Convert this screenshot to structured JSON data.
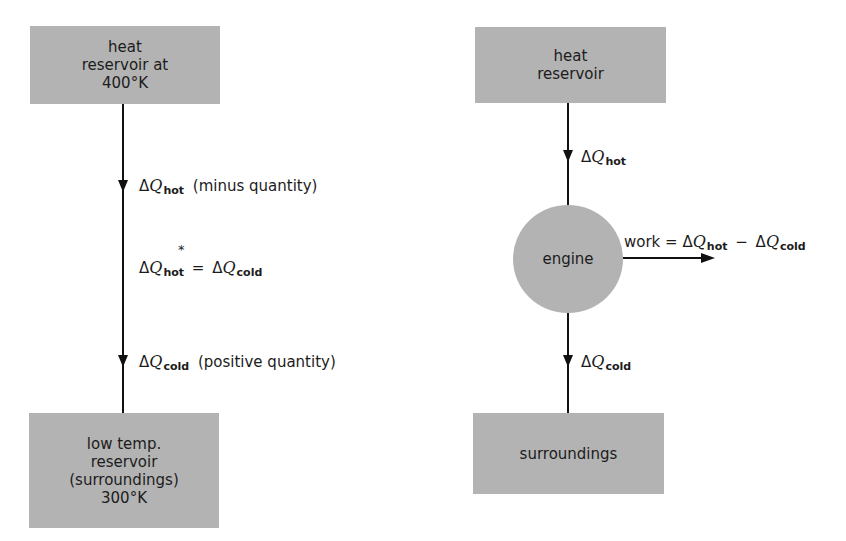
{
  "left_diagram": {
    "hot_box": {
      "lines": [
        "heat",
        "reservoir at",
        "400°K"
      ]
    },
    "cold_box": {
      "lines": [
        "low temp.",
        "reservoir",
        "(surroundings)",
        "300°K"
      ]
    },
    "label_hot": {
      "delta": "Δ",
      "q": "Q",
      "sub": "hot",
      "note": "(minus quantity)"
    },
    "label_equality": {
      "delta1": "Δ",
      "q1": "Q",
      "sub1": "hot",
      "star": "*",
      "eq": "=",
      "delta2": "Δ",
      "q2": "Q",
      "sub2": "cold"
    },
    "label_cold": {
      "delta": "Δ",
      "q": "Q",
      "sub": "cold",
      "note": "(positive quantity)"
    }
  },
  "right_diagram": {
    "hot_box": {
      "lines": [
        "heat",
        "reservoir"
      ]
    },
    "engine": {
      "label": "engine"
    },
    "cold_box": {
      "lines": [
        "surroundings"
      ]
    },
    "label_hot": {
      "delta": "Δ",
      "q": "Q",
      "sub": "hot"
    },
    "label_cold": {
      "delta": "Δ",
      "q": "Q",
      "sub": "cold"
    },
    "label_work": {
      "prefix": "work =",
      "delta1": "Δ",
      "q1": "Q",
      "sub1": "hot",
      "minus": "−",
      "delta2": "Δ",
      "q2": "Q",
      "sub2": "cold"
    }
  },
  "colors": {
    "box_fill": "#b3b3b3",
    "line": "#111111",
    "background": "#ffffff"
  }
}
